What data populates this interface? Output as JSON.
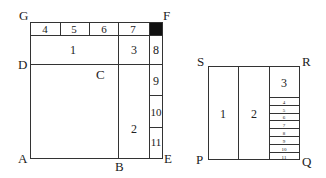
{
  "left_figure": {
    "vertex_labels": {
      "G": "G",
      "F": "F",
      "D": "D",
      "C": "C",
      "A": "A",
      "B": "B",
      "E": "E"
    },
    "regions": {
      "r1": "1",
      "r2": "2",
      "r3": "3",
      "r4": "4",
      "r5": "5",
      "r6": "6",
      "r7": "7",
      "r8": "8",
      "r9": "9",
      "r10": "10",
      "r11": "11"
    },
    "filled_cell_color": "#111111"
  },
  "right_figure": {
    "vertex_labels": {
      "S": "S",
      "R": "R",
      "P": "P",
      "Q": "Q"
    },
    "regions": {
      "r1": "1",
      "r2": "2",
      "r3": "3",
      "r4": "4",
      "r5": "5",
      "r6": "6",
      "r7": "7",
      "r8": "8",
      "r9": "9",
      "r10": "10",
      "r11": "11"
    }
  }
}
